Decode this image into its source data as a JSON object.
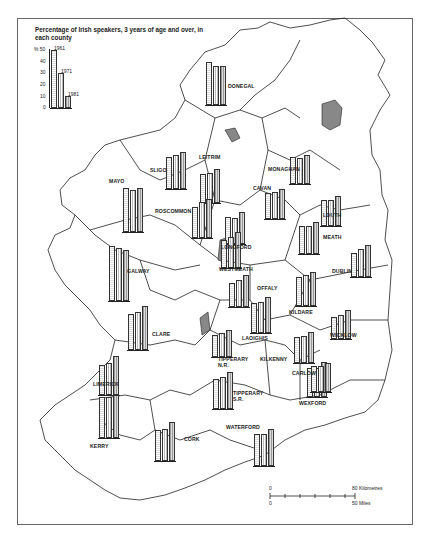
{
  "title": "Percentage of Irish speakers, 3 years of age and over, in each county",
  "legend": {
    "unit": "%",
    "ticks": [
      "50",
      "40",
      "30",
      "20",
      "10",
      "0"
    ],
    "years": [
      "1961",
      "1971",
      "1981"
    ],
    "example_values": [
      50,
      30,
      10
    ]
  },
  "scale_bar": {
    "km_start": "0",
    "km_end": "80 Kilometres",
    "mi_start": "0",
    "mi_end": "50 Miles"
  },
  "chart_data": {
    "type": "bar",
    "title": "Percentage of Irish speakers, 3 years of age and over, in each county",
    "ylabel": "%",
    "ylim": [
      0,
      50
    ],
    "series_names": [
      "1961",
      "1971",
      "1981"
    ],
    "counties": [
      {
        "name": "DONEGAL",
        "values": [
          37,
          34,
          34
        ]
      },
      {
        "name": "SLIGO",
        "values": [
          28,
          29,
          32
        ]
      },
      {
        "name": "LEITRIM",
        "values": [
          25,
          26,
          29
        ]
      },
      {
        "name": "MONAGHAN",
        "values": [
          23,
          22,
          25
        ]
      },
      {
        "name": "MAYO",
        "values": [
          38,
          36,
          38
        ]
      },
      {
        "name": "CAVAN",
        "values": [
          22,
          23,
          26
        ]
      },
      {
        "name": "LOUTH",
        "values": [
          22,
          22,
          26
        ]
      },
      {
        "name": "ROSCOMMON",
        "values": [
          27,
          31,
          34
        ]
      },
      {
        "name": "MEATH",
        "values": [
          24,
          24,
          28
        ]
      },
      {
        "name": "LONGFORD",
        "values": [
          23,
          22,
          28
        ]
      },
      {
        "name": "DUBLIN",
        "values": [
          21,
          24,
          28
        ]
      },
      {
        "name": "GALWAY",
        "values": [
          47,
          46,
          44
        ]
      },
      {
        "name": "WESTMEATH",
        "values": [
          24,
          27,
          31
        ]
      },
      {
        "name": "OFFALY",
        "values": [
          21,
          23,
          28
        ]
      },
      {
        "name": "KILDARE",
        "values": [
          25,
          27,
          29
        ]
      },
      {
        "name": "WICKLOW",
        "values": [
          19,
          21,
          25
        ]
      },
      {
        "name": "CLARE",
        "values": [
          31,
          33,
          38
        ]
      },
      {
        "name": "LAOIGHIS",
        "values": [
          26,
          27,
          31
        ]
      },
      {
        "name": "TIPPERARY N.R.",
        "values": [
          19,
          21,
          23
        ]
      },
      {
        "name": "KILKENNY",
        "values": [
          25,
          25,
          30
        ]
      },
      {
        "name": "CARLOW",
        "values": [
          22,
          23,
          27
        ]
      },
      {
        "name": "LIMERICK",
        "values": [
          26,
          28,
          34
        ]
      },
      {
        "name": "TIPPERARY S.R.",
        "values": [
          26,
          28,
          32
        ]
      },
      {
        "name": "WEXFORD",
        "values": [
          22,
          22,
          25
        ]
      },
      {
        "name": "KERRY",
        "values": [
          35,
          35,
          37
        ]
      },
      {
        "name": "CORK",
        "values": [
          27,
          28,
          34
        ]
      },
      {
        "name": "WATERFORD",
        "values": [
          28,
          28,
          32
        ]
      }
    ]
  },
  "labels": {
    "donegal": "DONEGAL",
    "sligo": "SLIGO",
    "leitrim": "LEITRIM",
    "monaghan": "MONAGHAN",
    "mayo": "MAYO",
    "cavan": "CAVAN",
    "louth": "LOUTH",
    "roscommon": "ROSCOMMON",
    "meath": "MEATH",
    "longford": "LONGFORD",
    "dublin": "DUBLIN",
    "galway": "GALWAY",
    "westmeath": "WESTMEATH",
    "offaly": "OFFALY",
    "kildare": "KILDARE",
    "wicklow": "WICKLOW",
    "clare": "CLARE",
    "laoighis": "LAOIGHIS",
    "tipperary_nr": "TIPPERARY N.R.",
    "kilkenny": "KILKENNY",
    "carlow": "CARLOW",
    "limerick": "LIMERICK",
    "tipperary_sr": "TIPPERARY S.R.",
    "wexford": "WEXFORD",
    "kerry": "KERRY",
    "cork": "CORK",
    "waterford": "WATERFORD"
  }
}
